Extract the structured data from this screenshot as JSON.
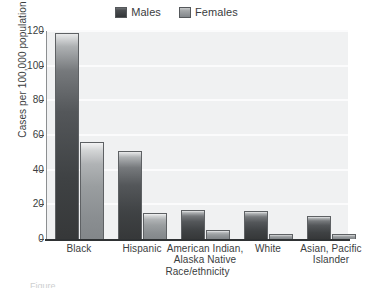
{
  "chart_data": {
    "type": "bar",
    "title": "",
    "xlabel": "Race/ethnicity",
    "ylabel": "Cases per 100,000 population",
    "ylim": [
      0,
      120
    ],
    "ytick_labels": [
      "0",
      "20",
      "40",
      "60",
      "80",
      "100",
      "120"
    ],
    "ytick_values": [
      0,
      20,
      40,
      60,
      80,
      100,
      120
    ],
    "grid": true,
    "grid_axis": "y",
    "legend_position": "top-center",
    "categories": [
      "Black",
      "Hispanic",
      "American Indian,\nAlaska Native",
      "White",
      "Asian, Pacific\nIslander"
    ],
    "category_lines": [
      [
        "Black"
      ],
      [
        "Hispanic"
      ],
      [
        "American Indian,",
        "Alaska Native"
      ],
      [
        "White"
      ],
      [
        "Asian, Pacific",
        "Islander"
      ]
    ],
    "series": [
      {
        "name": "Males",
        "color": "#3f4244",
        "values": [
          119,
          51,
          17,
          16,
          13
        ]
      },
      {
        "name": "Females",
        "color": "#9a9ea0",
        "values": [
          56,
          15,
          5,
          3,
          3
        ]
      }
    ]
  },
  "legend": {
    "entries": [
      {
        "label": "Males",
        "swatch": "males-swatch"
      },
      {
        "label": "Females",
        "swatch": "females-swatch"
      }
    ]
  },
  "colors": {
    "plot_background": "#f0f1f2",
    "gridline": "#fbfbfc",
    "axis": "#2f3234",
    "males_bar": "#3f4244",
    "females_bar": "#9a9ea0",
    "text": "#3a3d40",
    "page_background": "#ffffff"
  },
  "caption_remnant": "Figure"
}
